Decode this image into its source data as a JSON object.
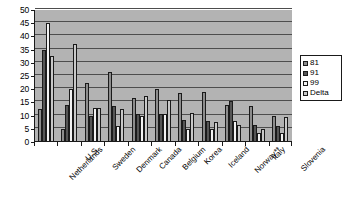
{
  "chart_data": {
    "type": "bar",
    "title": "",
    "subtitle": "",
    "xlabel": "",
    "ylabel": "",
    "ylim": [
      0,
      50
    ],
    "yticks": [
      0,
      5,
      10,
      15,
      20,
      25,
      30,
      35,
      40,
      45,
      50
    ],
    "grid": true,
    "legend_position": "right",
    "categories": [
      "Netherlands",
      "U.S.",
      "Sweden",
      "Denmark",
      "Canada",
      "Belgium",
      "Korea",
      "Iceland",
      "Norway**",
      "Italy",
      "Slovenia"
    ],
    "series": [
      {
        "name": "81",
        "color": "#8c8c8c",
        "values": [
          12.5,
          5.0,
          22.5,
          26.5,
          16.5,
          20.0,
          18.5,
          19.0,
          14.0,
          13.5,
          10.0
        ]
      },
      {
        "name": "91",
        "color": "#555555",
        "values": [
          35.0,
          14.0,
          10.0,
          13.5,
          10.5,
          10.5,
          8.5,
          8.0,
          15.5,
          6.5,
          6.0
        ]
      },
      {
        "name": "99",
        "color": "#f2f2f2",
        "values": [
          45.0,
          20.0,
          13.0,
          6.0,
          10.0,
          10.5,
          5.0,
          5.0,
          8.0,
          3.5,
          3.5
        ]
      },
      {
        "name": "Delta",
        "color": "#c9c9c9",
        "values": [
          32.5,
          37.0,
          13.0,
          12.5,
          17.5,
          16.0,
          11.0,
          7.5,
          6.5,
          5.0,
          9.5
        ]
      }
    ]
  },
  "legend": {
    "items": [
      {
        "label": "81"
      },
      {
        "label": "91"
      },
      {
        "label": "99"
      },
      {
        "label": "Delta"
      }
    ]
  },
  "colors": {
    "plot_background": "#b3b3b3",
    "page_background": "#ffffff",
    "axis": "#1a1a1a",
    "gridline": "#4d4d4d"
  }
}
